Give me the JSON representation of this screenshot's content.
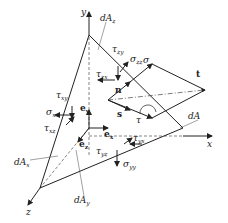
{
  "axes": {
    "x": "x",
    "y": "y",
    "z": "z"
  },
  "areas": {
    "dAx": {
      "base": "dA",
      "sub": "x"
    },
    "dAy": {
      "base": "dA",
      "sub": "y"
    },
    "dAz": {
      "base": "dA",
      "sub": "z"
    },
    "dA": "dA"
  },
  "unit_vectors": {
    "ex": {
      "base": "e",
      "sub": "x"
    },
    "ey": {
      "base": "e",
      "sub": "y"
    },
    "ez": {
      "base": "e",
      "sub": "z"
    }
  },
  "vectors": {
    "n": "n",
    "s": "s",
    "t": "t",
    "sigma": "σ",
    "tau": "τ"
  },
  "stresses": {
    "tau_zy": {
      "base": "τ",
      "sub": "zy"
    },
    "sigma_zz": {
      "base": "σ",
      "sub": "zz"
    },
    "tau_zx": {
      "base": "τ",
      "sub": "zx"
    },
    "tau_xy": {
      "base": "τ",
      "sub": "xy"
    },
    "sigma_xx": {
      "base": "σ",
      "sub": "xx"
    },
    "tau_xz": {
      "base": "τ",
      "sub": "xz"
    },
    "tau_yz": {
      "base": "τ",
      "sub": "yz"
    },
    "tau_yx": {
      "base": "τ",
      "sub": "yx"
    },
    "sigma_yy": {
      "base": "σ",
      "sub": "yy"
    }
  }
}
